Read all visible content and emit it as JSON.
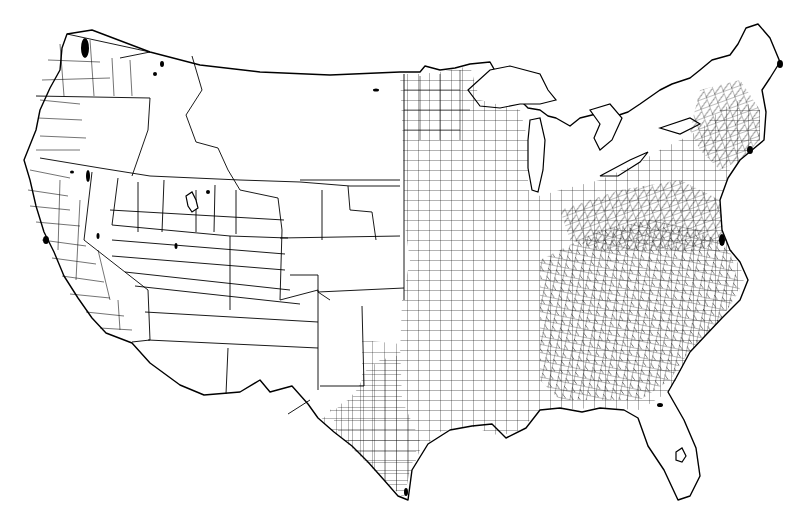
{
  "map": {
    "type": "choropleth-outline",
    "subject": "United States (contiguous) county boundaries",
    "style": "black line art on white background",
    "colors": {
      "background": "#ffffff",
      "line": "#000000"
    },
    "labels": [],
    "legend": null
  }
}
